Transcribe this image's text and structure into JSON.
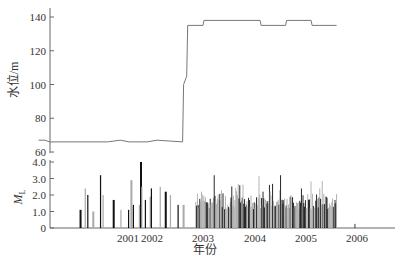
{
  "chart_data": [
    {
      "type": "line",
      "panel": "top",
      "title": "",
      "ylabel": "水位/m",
      "xlabel": "",
      "ylim": [
        60,
        140
      ],
      "yticks": [
        60,
        80,
        100,
        120,
        140
      ],
      "grid": false,
      "series": [
        {
          "name": "水位",
          "x": [
            2000.0,
            2000.25,
            2000.45,
            2001.1,
            2001.35,
            2001.55,
            2002.3,
            2002.6,
            2003.1,
            2003.12,
            2003.18,
            2003.2,
            2003.5,
            2003.52,
            2004.0,
            2004.02,
            2004.6,
            2004.62,
            2005.1,
            2005.12,
            2005.6,
            2005.62,
            2006.1
          ],
          "values": [
            67,
            67,
            66,
            66,
            67,
            66,
            66,
            67,
            66,
            100,
            105,
            135,
            135,
            138,
            138,
            138,
            138,
            135,
            135,
            138,
            138,
            135,
            135
          ]
        }
      ]
    },
    {
      "type": "bar",
      "panel": "bottom",
      "title": "",
      "ylabel": "ML",
      "xlabel": "年份",
      "ylim": [
        0,
        4.0
      ],
      "yticks": [
        "0",
        "1.0",
        "2.0",
        "3.0",
        "4.0"
      ],
      "xticks": [
        "2001",
        "2002",
        "2003",
        "2004",
        "2005",
        "2006"
      ],
      "grid": false,
      "note": "Dense earthquake magnitude bars; sparse 2000-2003, dense 2003.3-2006.1, max ~4.0 in early 2002",
      "series": [
        {
          "name": "ML",
          "x": [
            2000.55,
            2000.65,
            2000.7,
            2000.8,
            2000.95,
            2001.0,
            2001.2,
            2001.35,
            2001.5,
            2001.6,
            2001.7,
            2001.95,
            2002.0,
            2002.05,
            2002.2,
            2002.4,
            2002.45,
            2002.65,
            2002.75,
            2002.85,
            2003.0,
            2003.1
          ],
          "values": [
            1.1,
            2.4,
            2.0,
            1.0,
            3.2,
            2.0,
            1.7,
            1.1,
            1.1,
            2.9,
            1.4,
            1.4,
            4.0,
            2.5,
            1.7,
            1.9,
            2.4,
            2.5,
            2.2,
            2.0,
            1.4,
            1.4
          ]
        }
      ],
      "dense_region": {
        "x_start": 2003.35,
        "x_end": 2006.1,
        "typical_value": 1.6,
        "max_value": 3.2
      }
    }
  ],
  "labels": {
    "top_ylabel": "水位/m",
    "bottom_ylabel": "M",
    "bottom_ylabel_sub": "L",
    "xlabel": "年份",
    "top_yticks": [
      "60",
      "80",
      "100",
      "120",
      "140"
    ],
    "bottom_yticks": [
      "0",
      "1.0",
      "2.0",
      "3.0",
      "4.0"
    ],
    "xticks": [
      "2001",
      "2002",
      "2003",
      "2004",
      "2005",
      "2006"
    ]
  },
  "colors": {
    "line": "#777777",
    "axis": "#555555",
    "bar_dark": "#111111",
    "bar_light": "#aaaaaa"
  }
}
